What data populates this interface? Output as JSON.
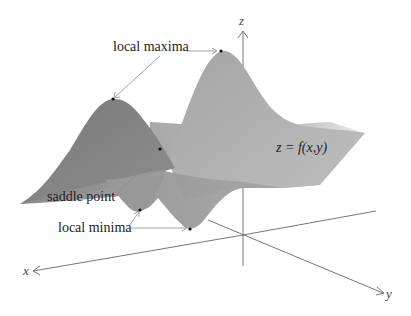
{
  "figure": {
    "surface_label": "z = f(x,y)",
    "axes": {
      "x": "x",
      "y": "y",
      "z": "z"
    },
    "annotations": {
      "local_maxima": "local maxima",
      "saddle_point": "saddle point",
      "local_minima": "local minima"
    },
    "colors": {
      "surface_dark": "#7d7d7d",
      "surface_mid": "#9a9a9a",
      "surface_light": "#b9b9b9",
      "axis": "#555555",
      "leader": "#8a8a8a",
      "point": "#111111"
    }
  }
}
